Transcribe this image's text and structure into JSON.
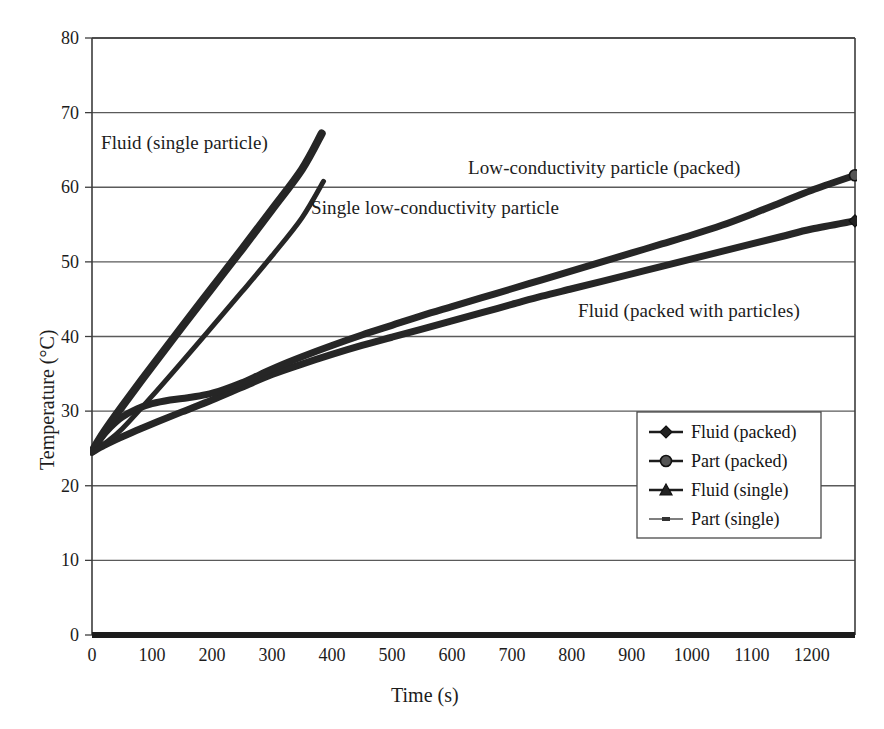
{
  "chart_data": {
    "type": "line",
    "title": "",
    "xlabel": "Time (s)",
    "ylabel": "Temperature (°C)",
    "xlim": [
      0,
      1272
    ],
    "ylim": [
      0,
      80
    ],
    "xticks": [
      0,
      100,
      200,
      300,
      400,
      500,
      600,
      700,
      800,
      900,
      1000,
      1100,
      1200
    ],
    "yticks": [
      0,
      10,
      20,
      30,
      40,
      50,
      60,
      70,
      80
    ],
    "grid": "horizontal",
    "legend_position": "center-right-inside",
    "series": [
      {
        "name": "Fluid (packed)",
        "marker": "diamond",
        "points": [
          [
            0,
            24.5
          ],
          [
            20,
            25.4
          ],
          [
            40,
            26.2
          ],
          [
            60,
            26.9
          ],
          [
            80,
            27.6
          ],
          [
            110,
            28.6
          ],
          [
            150,
            29.9
          ],
          [
            200,
            31.5
          ],
          [
            250,
            33.2
          ],
          [
            300,
            34.9
          ],
          [
            350,
            36.3
          ],
          [
            400,
            37.6
          ],
          [
            450,
            38.8
          ],
          [
            500,
            39.9
          ],
          [
            550,
            41.0
          ],
          [
            600,
            42.1
          ],
          [
            650,
            43.2
          ],
          [
            700,
            44.3
          ],
          [
            750,
            45.4
          ],
          [
            800,
            46.4
          ],
          [
            850,
            47.4
          ],
          [
            900,
            48.4
          ],
          [
            950,
            49.4
          ],
          [
            1000,
            50.4
          ],
          [
            1050,
            51.4
          ],
          [
            1100,
            52.4
          ],
          [
            1150,
            53.4
          ],
          [
            1200,
            54.4
          ],
          [
            1272,
            55.5
          ]
        ]
      },
      {
        "name": "Part (packed)",
        "marker": "circle",
        "points": [
          [
            0,
            24.6
          ],
          [
            15,
            26.4
          ],
          [
            30,
            27.8
          ],
          [
            50,
            29.2
          ],
          [
            75,
            30.3
          ],
          [
            100,
            31.0
          ],
          [
            130,
            31.5
          ],
          [
            160,
            31.8
          ],
          [
            190,
            32.2
          ],
          [
            220,
            32.9
          ],
          [
            250,
            33.8
          ],
          [
            280,
            34.9
          ],
          [
            310,
            36.0
          ],
          [
            350,
            37.3
          ],
          [
            400,
            38.8
          ],
          [
            450,
            40.2
          ],
          [
            500,
            41.5
          ],
          [
            550,
            42.8
          ],
          [
            600,
            44.0
          ],
          [
            650,
            45.2
          ],
          [
            700,
            46.4
          ],
          [
            750,
            47.6
          ],
          [
            800,
            48.8
          ],
          [
            850,
            50.0
          ],
          [
            900,
            51.2
          ],
          [
            950,
            52.4
          ],
          [
            1000,
            53.6
          ],
          [
            1050,
            54.9
          ],
          [
            1100,
            56.4
          ],
          [
            1150,
            58.0
          ],
          [
            1200,
            59.6
          ],
          [
            1272,
            61.6
          ]
        ]
      },
      {
        "name": "Fluid (single)",
        "marker": "triangle",
        "points": [
          [
            0,
            24.6
          ],
          [
            20,
            27.2
          ],
          [
            50,
            30.6
          ],
          [
            100,
            36.0
          ],
          [
            150,
            41.3
          ],
          [
            200,
            46.5
          ],
          [
            250,
            51.7
          ],
          [
            300,
            57.0
          ],
          [
            350,
            62.4
          ],
          [
            383,
            67.2
          ]
        ]
      },
      {
        "name": "Part (single)",
        "marker": "dash",
        "points": [
          [
            0,
            24.4
          ],
          [
            20,
            25.6
          ],
          [
            50,
            27.6
          ],
          [
            100,
            32.0
          ],
          [
            150,
            36.6
          ],
          [
            200,
            41.3
          ],
          [
            250,
            46.0
          ],
          [
            300,
            50.8
          ],
          [
            350,
            55.9
          ],
          [
            386,
            60.8
          ]
        ]
      }
    ],
    "annotations": [
      {
        "text": "Fluid (single particle)",
        "x_px": 101,
        "y_px": 132
      },
      {
        "text": "Single low-conductivity particle",
        "x_px": 311,
        "y_px": 197
      },
      {
        "text": "Low-conductivity particle (packed)",
        "x_px": 468,
        "y_px": 157
      },
      {
        "text": "Fluid (packed with particles)",
        "x_px": 578,
        "y_px": 300
      }
    ],
    "legend_entries": [
      "Fluid (packed)",
      "Part (packed)",
      "Fluid (single)",
      "Part (single)"
    ],
    "colors": {
      "series_line": "#262626",
      "axis": "#3d3d3d",
      "grid": "#5a5a5a",
      "text": "#1c1c1c",
      "background": "#ffffff"
    }
  }
}
